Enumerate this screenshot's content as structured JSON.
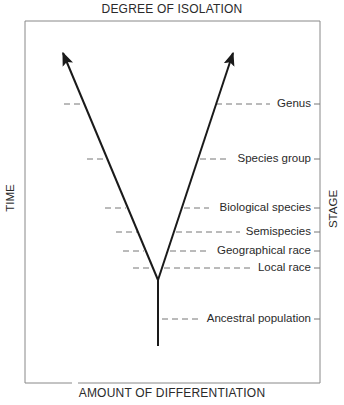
{
  "diagram": {
    "title_top": "DEGREE OF ISOLATION",
    "title_bottom": "AMOUNT OF DIFFERENTIATION",
    "axis_left": "TIME",
    "axis_right": "STAGE",
    "stages": [
      {
        "label": "Genus",
        "y": 104
      },
      {
        "label": "Species group",
        "y": 159
      },
      {
        "label": "Biological species",
        "y": 208
      },
      {
        "label": "Semispecies",
        "y": 232
      },
      {
        "label": "Geographical race",
        "y": 251
      },
      {
        "label": "Local race",
        "y": 268
      },
      {
        "label": "Ancestral population",
        "y": 319
      }
    ],
    "colors": {
      "line": "#1a1a1a",
      "frame": "#888888",
      "dash": "#777777",
      "text": "#2a2a2a"
    }
  }
}
